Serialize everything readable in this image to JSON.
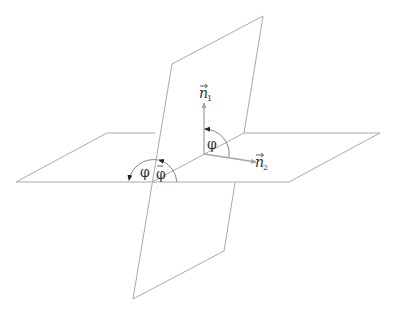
{
  "diagram": {
    "colors": {
      "plane_edge": "#a9a9a9",
      "normal_vector": "#a6a6a6",
      "angle_arc": "#777777",
      "text": "#333333"
    },
    "labels": {
      "normal_1": {
        "symbol": "n",
        "subscript": "1",
        "vector_arrow": true
      },
      "normal_2": {
        "symbol": "n",
        "subscript": "2",
        "vector_arrow": true
      },
      "angle_between_normals": "φ",
      "angle_between_planes": "φ",
      "supplementary_angle": "φ",
      "supplementary_angle_marker": "bar"
    },
    "elements": [
      {
        "name": "horizontal-plane",
        "type": "parallelogram"
      },
      {
        "name": "vertical-plane",
        "type": "parallelogram"
      },
      {
        "name": "intersection-line",
        "type": "line"
      },
      {
        "name": "normal-vector-1",
        "type": "arrow"
      },
      {
        "name": "normal-vector-2",
        "type": "arrow"
      },
      {
        "name": "angle-arc-normals",
        "type": "arc"
      },
      {
        "name": "angle-arc-planes",
        "type": "arc"
      },
      {
        "name": "angle-arc-supplementary",
        "type": "arc"
      }
    ]
  }
}
